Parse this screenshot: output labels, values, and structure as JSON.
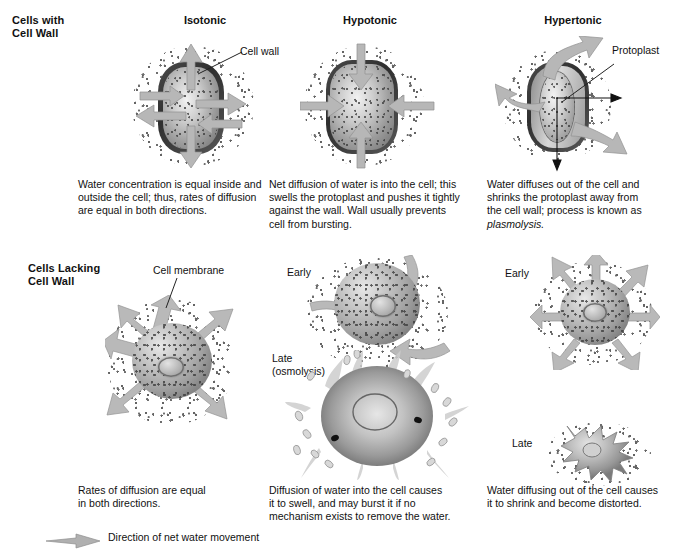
{
  "figure": {
    "row_headers": [
      {
        "line1": "Cells with",
        "line2": "Cell Wall"
      },
      {
        "line1": "Cells Lacking",
        "line2": "Cell Wall"
      }
    ],
    "column_headers": [
      "Isotonic",
      "Hypotonic",
      "Hypertonic"
    ],
    "legend": {
      "icon": "arrow-right-icon",
      "label": "Direction of net water movement",
      "arrow_color": "#b0b0b0"
    }
  },
  "walled_row": {
    "isotonic": {
      "label": "Isotonic",
      "callout": "Cell wall",
      "caption_lines": [
        "Water concentration is equal inside and",
        "outside the cell; thus, rates of diffusion",
        "are equal in both directions."
      ],
      "caption": "Water concentration is equal inside and outside the cell; thus, rates of diffusion are equal in both directions.",
      "arrow_pattern": "bidirectional-equal"
    },
    "hypotonic": {
      "label": "Hypotonic",
      "callout": "",
      "caption_lines": [
        "Net diffusion of water is into the cell; this",
        "swells the protoplast and pushes it tightly",
        "against the wall. Wall usually prevents",
        "cell from bursting."
      ],
      "caption": "Net diffusion of water is into the cell; this swells the protoplast and pushes it tightly against the wall. Wall usually prevents cell from bursting.",
      "arrow_pattern": "inward"
    },
    "hypertonic": {
      "label": "Hypertonic",
      "callout": "Protoplast",
      "caption_lines": [
        "Water diffuses out of the cell and",
        "shrinks the protoplast away from",
        "the cell wall; process is known as",
        "plasmolysis."
      ],
      "caption": "Water diffuses out of the cell and shrinks the protoplast away from the cell wall; process is known as plasmolysis.",
      "caption_italic_word": "plasmolysis.",
      "arrow_pattern": "outward"
    }
  },
  "wall_less_row": {
    "isotonic": {
      "callout": "Cell membrane",
      "caption_lines": [
        "Rates of diffusion are equal",
        "in both directions."
      ],
      "caption": "Rates of diffusion are equal in both directions.",
      "arrow_pattern": "bidirectional-equal"
    },
    "hypotonic": {
      "stage_early": "Early",
      "stage_late_line1": "Late",
      "stage_late_line2": "(osmolysis)",
      "caption_lines": [
        "Diffusion of water into the cell causes",
        "it to swell, and may burst it if no",
        "mechanism exists to remove the water."
      ],
      "caption": "Diffusion of water into the cell causes it to swell, and may burst it if no mechanism exists to remove the water.",
      "arrow_pattern": "inward"
    },
    "hypertonic": {
      "stage_early": "Early",
      "stage_late": "Late",
      "caption_lines": [
        "Water diffusing out of the cell causes",
        "it to shrink and become distorted."
      ],
      "caption": "Water diffusing out of the cell causes it to shrink and become distorted.",
      "arrow_pattern": "outward"
    }
  },
  "colors": {
    "background": "#ffffff",
    "text": "#111111",
    "arrow_fill": "#b7b7b7",
    "arrow_stroke": "#8e8e8e",
    "cell_wall": "#3a3a3a",
    "cytoplasm": "#bdbdbd",
    "speckle": "#4a4a4a"
  }
}
